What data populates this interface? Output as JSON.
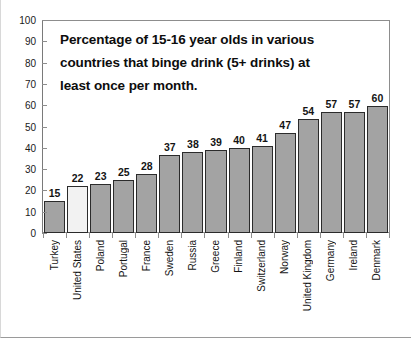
{
  "chart_data": {
    "type": "bar",
    "title_lines": [
      "Percentage of 15-16 year olds in various",
      "countries that binge drink (5+ drinks) at",
      "least once per month."
    ],
    "xlabel": "",
    "ylabel": "",
    "ylim": [
      0,
      100
    ],
    "y_ticks": [
      0,
      10,
      20,
      30,
      40,
      50,
      60,
      70,
      80,
      90,
      100
    ],
    "y_tick_labels": [
      "0",
      "10",
      "20",
      "30",
      "40",
      "50",
      "60",
      "70",
      "80",
      "90",
      "100"
    ],
    "grid": false,
    "legend": false,
    "categories": [
      "Turkey",
      "United States",
      "Poland",
      "Portugal",
      "France",
      "Sweden",
      "Russia",
      "Greece",
      "Finland",
      "Switzerland",
      "Norway",
      "United Kingdom",
      "Germany",
      "Ireland",
      "Denmark"
    ],
    "values": [
      15,
      22,
      23,
      25,
      28,
      37,
      38,
      39,
      40,
      41,
      47,
      54,
      57,
      57,
      60
    ],
    "value_labels": [
      "15",
      "22",
      "23",
      "25",
      "28",
      "37",
      "38",
      "39",
      "40",
      "41",
      "47",
      "54",
      "57",
      "57",
      "60"
    ],
    "highlighted_category": "United States",
    "highlight_style": "dotted-pattern-fill",
    "colors": {
      "bar_fill": "#a3a3a3",
      "bar_border": "#2b2b2b",
      "highlight_fill": "#f2f2f2",
      "highlight_dots": "#b9b9b9",
      "axis": "#8d8d8d",
      "text": "#141414",
      "background": "#ffffff"
    }
  }
}
